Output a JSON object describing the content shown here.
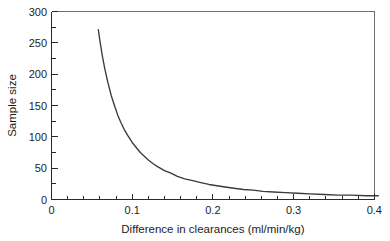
{
  "chart_data": {
    "type": "line",
    "title": "",
    "xlabel": "Difference in clearances (ml/min/kg)",
    "ylabel": "Sample size",
    "xlim": [
      0,
      0.4
    ],
    "ylim": [
      0,
      300
    ],
    "grid": false,
    "legend": null,
    "xticks": [
      0,
      0.1,
      0.2,
      0.3,
      0.4
    ],
    "xtick_labels": [
      "0",
      "0.1",
      "0.2",
      "0.3",
      "0.4"
    ],
    "xminor_step": 0.02,
    "yticks": [
      0,
      50,
      100,
      150,
      200,
      250,
      300
    ],
    "ytick_labels": [
      "0",
      "50",
      "100",
      "150",
      "200",
      "250",
      "300"
    ],
    "yminor_step": 25,
    "series": [
      {
        "name": "Required sample size",
        "color": "#3a3a3a",
        "relationship": "n = 0.91 / d^2",
        "x": [
          0.058,
          0.06,
          0.063,
          0.066,
          0.07,
          0.074,
          0.078,
          0.082,
          0.086,
          0.09,
          0.095,
          0.1,
          0.105,
          0.11,
          0.115,
          0.12,
          0.126,
          0.132,
          0.14,
          0.148,
          0.156,
          0.165,
          0.175,
          0.185,
          0.195,
          0.205,
          0.215,
          0.226,
          0.238,
          0.25,
          0.262,
          0.275,
          0.29,
          0.305,
          0.32,
          0.338,
          0.355,
          0.372,
          0.39,
          0.405
        ],
        "y": [
          271,
          253,
          229,
          209,
          186,
          166,
          150,
          135,
          123,
          112,
          101,
          91,
          83,
          75,
          69,
          63,
          57,
          52,
          46,
          42,
          37,
          33,
          30,
          27,
          24,
          22,
          20,
          18,
          16,
          15,
          13,
          12,
          11,
          10,
          9,
          8,
          7,
          7,
          6,
          6
        ],
        "y_values_note": "Sample size (number of subjects)",
        "start_point": {
          "x": 0.058,
          "y": 271
        },
        "end_point": {
          "x": 0.405,
          "y": 6
        }
      }
    ]
  },
  "axes": {
    "y_title": "Sample size",
    "x_title": "Difference in clearances (ml/min/kg)"
  },
  "colors": {
    "curve": "#3a3a3a",
    "axis": "#2b2b2b",
    "frame": "#6e6e6e",
    "background": "#ffffff",
    "text": "#1c1c1c"
  }
}
